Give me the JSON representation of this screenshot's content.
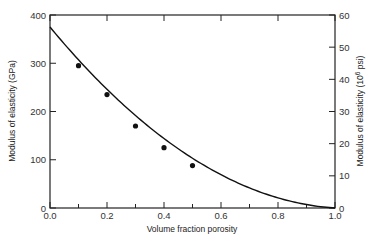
{
  "chart_data": {
    "type": "scatter",
    "title": "",
    "xlabel": "Volume fraction porosity",
    "ylabel": "Modulus of elasticity (GPa)",
    "y2label": "Modulus of elasticity (10^6 psi)",
    "y2label_parts": {
      "prefix": "Modulus of elasticity (10",
      "sup": "6",
      "suffix": " psi)"
    },
    "xlim": [
      0.0,
      1.0
    ],
    "ylim": [
      0,
      400
    ],
    "y2lim": [
      0,
      60
    ],
    "xticks": [
      "0.0",
      "0.2",
      "0.4",
      "0.6",
      "0.8",
      "1.0"
    ],
    "xticks_values": [
      0.0,
      0.2,
      0.4,
      0.6,
      0.8,
      1.0
    ],
    "xminor_ticks": [
      0.1,
      0.3,
      0.5,
      0.7,
      0.9
    ],
    "yticks": [
      "0",
      "100",
      "200",
      "300",
      "400"
    ],
    "yticks_values": [
      0,
      100,
      200,
      300,
      400
    ],
    "y2ticks": [
      "0",
      "10",
      "20",
      "30",
      "40",
      "50",
      "60"
    ],
    "y2ticks_values": [
      0,
      10,
      20,
      30,
      40,
      50,
      60
    ],
    "grid": false,
    "legend": null,
    "series": [
      {
        "name": "Experimental data",
        "kind": "scatter",
        "x": [
          0.1,
          0.2,
          0.3,
          0.4,
          0.5
        ],
        "y": [
          295,
          235,
          170,
          125,
          88
        ]
      },
      {
        "name": "Fitted curve",
        "kind": "line",
        "equation": "E = 375 (1 - 1.9P + 0.9P^2)",
        "x": [
          0.0,
          0.1,
          0.2,
          0.3,
          0.4,
          0.5,
          0.6,
          0.7,
          0.8,
          0.9,
          1.0
        ],
        "y": [
          375,
          307,
          246,
          192,
          144,
          103,
          69,
          41,
          21,
          7,
          0
        ]
      }
    ]
  }
}
